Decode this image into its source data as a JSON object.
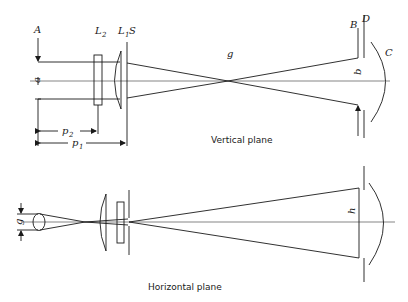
{
  "vertical_plane": {
    "caption": "Vertical plane",
    "labels": {
      "A": "A",
      "a": "a",
      "L2": "L",
      "L2_sub": "2",
      "L1": "L",
      "L1_sub": "1",
      "S": "S",
      "g": "g",
      "B": "B",
      "D": "D",
      "C": "C",
      "b": "b",
      "p2": "p",
      "p2_sub": "2",
      "p1": "p",
      "p1_sub": "1"
    }
  },
  "horizontal_plane": {
    "caption": "Horizontal plane",
    "labels": {
      "g": "g",
      "h": "h"
    }
  }
}
